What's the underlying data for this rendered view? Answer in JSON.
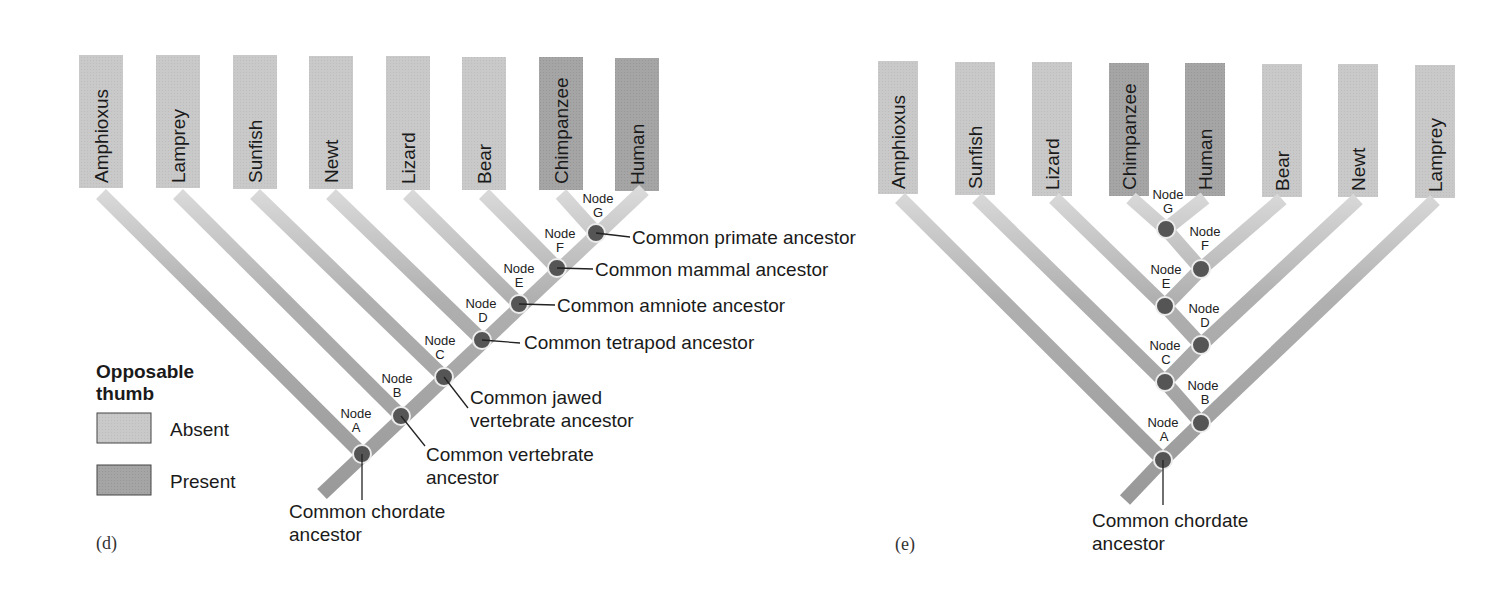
{
  "colors": {
    "absent": "#c8c8c8",
    "present": "#a3a3a3",
    "branch_dark": "#9a9a9a",
    "branch_light": "#d4d4d4",
    "node_fill": "#555555",
    "node_stroke": "#e8e8e8",
    "leader": "#222222"
  },
  "legend": {
    "title_line1": "Opposable",
    "title_line2": "thumb",
    "items": [
      {
        "label": "Absent",
        "state": "absent"
      },
      {
        "label": "Present",
        "state": "present"
      }
    ]
  },
  "panels": [
    {
      "label": "(d)",
      "taxa": [
        {
          "name": "Amphioxus",
          "thumb": "absent"
        },
        {
          "name": "Lamprey",
          "thumb": "absent"
        },
        {
          "name": "Sunfish",
          "thumb": "absent"
        },
        {
          "name": "Newt",
          "thumb": "absent"
        },
        {
          "name": "Lizard",
          "thumb": "absent"
        },
        {
          "name": "Bear",
          "thumb": "absent"
        },
        {
          "name": "Chimpanzee",
          "thumb": "present"
        },
        {
          "name": "Human",
          "thumb": "present"
        }
      ],
      "nodes": [
        {
          "id": "A",
          "label": "Node",
          "letter": "A",
          "ancestor": "Common chordate ancestor"
        },
        {
          "id": "B",
          "label": "Node",
          "letter": "B",
          "ancestor": "Common vertebrate ancestor"
        },
        {
          "id": "C",
          "label": "Node",
          "letter": "C",
          "ancestor": "Common jawed vertebrate ancestor"
        },
        {
          "id": "D",
          "label": "Node",
          "letter": "D",
          "ancestor": "Common tetrapod ancestor"
        },
        {
          "id": "E",
          "label": "Node",
          "letter": "E",
          "ancestor": "Common amniote ancestor"
        },
        {
          "id": "F",
          "label": "Node",
          "letter": "F",
          "ancestor": "Common mammal ancestor"
        },
        {
          "id": "G",
          "label": "Node",
          "letter": "G",
          "ancestor": "Common primate ancestor"
        }
      ]
    },
    {
      "label": "(e)",
      "taxa": [
        {
          "name": "Amphioxus",
          "thumb": "absent"
        },
        {
          "name": "Sunfish",
          "thumb": "absent"
        },
        {
          "name": "Lizard",
          "thumb": "absent"
        },
        {
          "name": "Chimpanzee",
          "thumb": "present"
        },
        {
          "name": "Human",
          "thumb": "present"
        },
        {
          "name": "Bear",
          "thumb": "absent"
        },
        {
          "name": "Newt",
          "thumb": "absent"
        },
        {
          "name": "Lamprey",
          "thumb": "absent"
        }
      ],
      "nodes": [
        {
          "id": "A",
          "label": "Node",
          "letter": "A",
          "ancestor": "Common chordate ancestor"
        },
        {
          "id": "B",
          "label": "Node",
          "letter": "B"
        },
        {
          "id": "C",
          "label": "Node",
          "letter": "C"
        },
        {
          "id": "D",
          "label": "Node",
          "letter": "D"
        },
        {
          "id": "E",
          "label": "Node",
          "letter": "E"
        },
        {
          "id": "F",
          "label": "Node",
          "letter": "F"
        },
        {
          "id": "G",
          "label": "Node",
          "letter": "G"
        }
      ]
    }
  ]
}
